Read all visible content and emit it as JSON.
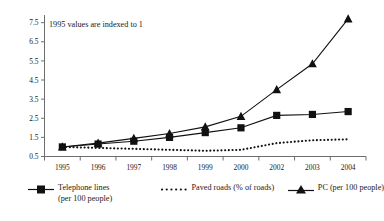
{
  "chart_data": {
    "type": "line",
    "title": "",
    "annotation": "1995 values are indexed to 1",
    "xlabel": "",
    "ylabel": "",
    "grid": false,
    "legend_position": "bottom",
    "x": [
      "1995",
      "1996",
      "1997",
      "1998",
      "1999",
      "2000",
      "2002",
      "2003",
      "2004"
    ],
    "xtick_labels": [
      "1995",
      "1996",
      "1997",
      "1998",
      "1999",
      "2000",
      "2002",
      "2003",
      "2004"
    ],
    "ytick_labels": [
      "0.5",
      "1.5",
      "2.5",
      "3.5",
      "4.5",
      "5.5",
      "6.5",
      "7.5"
    ],
    "ylim": [
      0.5,
      7.9
    ],
    "ytick_values": [
      0.5,
      1.5,
      2.5,
      3.5,
      4.5,
      5.5,
      6.5,
      7.5
    ],
    "series": [
      {
        "name": "Telephone lines (per 100 people)",
        "marker": "square",
        "style": "solid",
        "values": [
          1.0,
          1.15,
          1.3,
          1.5,
          1.75,
          2.0,
          2.65,
          2.7,
          2.85
        ]
      },
      {
        "name": "Paved roads (% of roads)",
        "marker": "none",
        "style": "dotted",
        "values": [
          1.0,
          0.95,
          0.9,
          0.85,
          0.8,
          0.85,
          1.2,
          1.35,
          1.4
        ]
      },
      {
        "name": "PC (per 100 people)",
        "marker": "triangle",
        "style": "solid",
        "values": [
          1.0,
          1.2,
          1.45,
          1.7,
          2.05,
          2.6,
          4.0,
          5.35,
          7.7
        ]
      }
    ]
  },
  "legend": {
    "items": [
      {
        "key": "telephone",
        "label_line1": "Telephone lines",
        "label_line2": "(per 100 people)",
        "glyph": "line-square-marker"
      },
      {
        "key": "paved",
        "label_line1": "Paved roads (% of roads)",
        "label_line2": "",
        "glyph": "dotted-line"
      },
      {
        "key": "pc",
        "label_line1": "PC (per 100 people)",
        "label_line2": "",
        "glyph": "line-triangle-marker"
      }
    ]
  },
  "colors": {
    "series_ink": "#111111",
    "axis": "#6e6e6e",
    "text": "#1a1a1a",
    "background": "#ffffff"
  }
}
